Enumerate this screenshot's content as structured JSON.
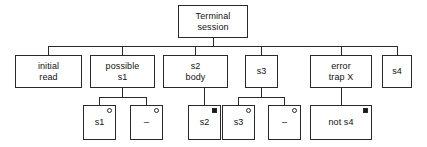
{
  "diagram": {
    "stroke_color": "#2a2a2a",
    "text_color": "#111111",
    "background_color": "#ffffff",
    "nodes": [
      {
        "id": "terminal-session",
        "label": "Terminal\nsession",
        "level": 0,
        "x": 178,
        "y": 5,
        "w": 70,
        "h": 33,
        "marker": "none"
      },
      {
        "id": "initial-read",
        "label": "initial\nread",
        "level": 1,
        "x": 15,
        "y": 55,
        "w": 67,
        "h": 33,
        "marker": "none"
      },
      {
        "id": "possible-s1",
        "label": "possible\ns1",
        "level": 1,
        "x": 90,
        "y": 55,
        "w": 65,
        "h": 33,
        "marker": "none"
      },
      {
        "id": "s2-body",
        "label": "s2\nbody",
        "level": 1,
        "x": 163,
        "y": 55,
        "w": 65,
        "h": 33,
        "marker": "none"
      },
      {
        "id": "s3-branch",
        "label": "s3",
        "level": 1,
        "x": 245,
        "y": 55,
        "w": 33,
        "h": 33,
        "marker": "none"
      },
      {
        "id": "error-trap-x",
        "label": "error\ntrap X",
        "level": 1,
        "x": 310,
        "y": 55,
        "w": 62,
        "h": 33,
        "marker": "none"
      },
      {
        "id": "s4-branch",
        "label": "s4",
        "level": 1,
        "x": 382,
        "y": 55,
        "w": 30,
        "h": 33,
        "marker": "none"
      },
      {
        "id": "leaf-s1",
        "label": "s1",
        "level": 2,
        "x": 83,
        "y": 105,
        "w": 33,
        "h": 35,
        "marker": "open"
      },
      {
        "id": "leaf-dash-1",
        "label": "–",
        "level": 2,
        "x": 130,
        "y": 105,
        "w": 33,
        "h": 35,
        "marker": "open"
      },
      {
        "id": "leaf-s2",
        "label": "s2",
        "level": 2,
        "x": 188,
        "y": 105,
        "w": 33,
        "h": 35,
        "marker": "filled"
      },
      {
        "id": "leaf-s3",
        "label": "s3",
        "level": 2,
        "x": 222,
        "y": 105,
        "w": 33,
        "h": 35,
        "marker": "open"
      },
      {
        "id": "leaf-dash-2",
        "label": "–",
        "level": 2,
        "x": 268,
        "y": 105,
        "w": 33,
        "h": 35,
        "marker": "open"
      },
      {
        "id": "leaf-not-s4",
        "label": "not s4",
        "level": 2,
        "x": 310,
        "y": 105,
        "w": 62,
        "h": 35,
        "marker": "filled"
      }
    ],
    "connectors": {
      "main_bus": {
        "parent_stem_x": 213,
        "parent_bottom_y": 38,
        "bus_y": 46,
        "bus_x1": 48,
        "bus_x2": 397,
        "child_stems": [
          48,
          122,
          195,
          261,
          341,
          397
        ],
        "child_top_y": 55
      },
      "possible_s1_bus": {
        "parent_stem_x": 122,
        "parent_bottom_y": 88,
        "bus_y": 97,
        "bus_x1": 99,
        "bus_x2": 146,
        "child_stems": [
          99,
          146
        ],
        "child_top_y": 105
      },
      "s2_body_stem": {
        "parent_stem_x": 204,
        "parent_bottom_y": 88,
        "child_top_y": 105
      },
      "s3_bus": {
        "parent_stem_x": 261,
        "parent_bottom_y": 88,
        "bus_y": 97,
        "bus_x1": 238,
        "bus_x2": 284,
        "child_stems": [
          238,
          284
        ],
        "child_top_y": 105
      },
      "error_trap_stem": {
        "parent_stem_x": 341,
        "parent_bottom_y": 88,
        "child_top_y": 105
      }
    },
    "markers_legend": {
      "open": "open-circle-marker",
      "filled": "filled-square-marker"
    }
  }
}
